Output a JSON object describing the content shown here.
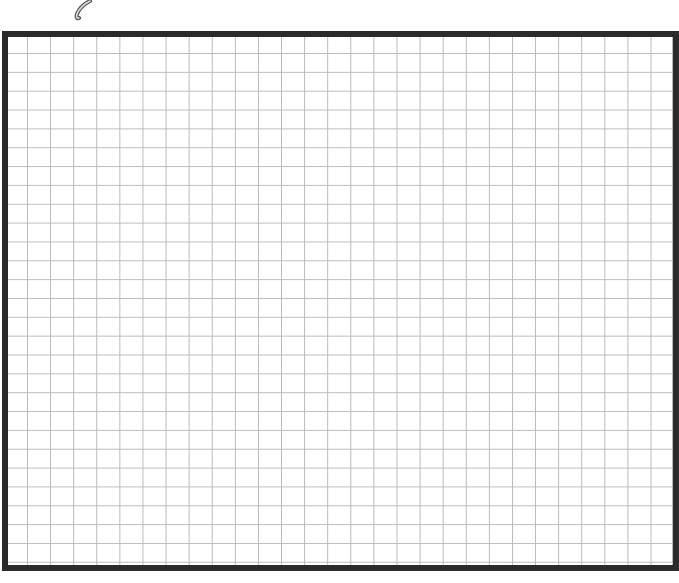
{
  "canvas": {
    "width": 679,
    "height": 583,
    "background": "#ffffff"
  },
  "icon": {
    "name": "hook-stroke-icon",
    "color": "#555555"
  },
  "grid": {
    "columns": 28,
    "rows": 28,
    "cell_width": 23.1,
    "cell_height": 18.85,
    "line_color": "#b8b8b8",
    "border_color": "#2b2b2b",
    "border_width": 6
  }
}
